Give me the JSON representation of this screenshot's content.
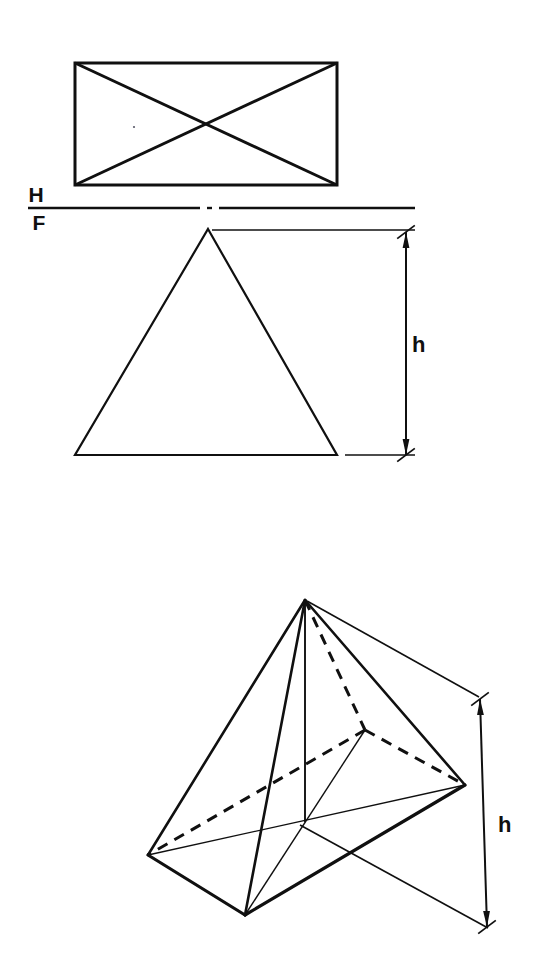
{
  "drawing": {
    "title": "Rectangular pyramid — orthographic and pictorial views",
    "background_color": "#ffffff",
    "line_color": "#101010",
    "views": {
      "top_view": {
        "name": "top-view",
        "description": "Rectangle with two crossing diagonals (plan of pyramid)",
        "rect": {
          "x": 75,
          "y": 63,
          "width": 262,
          "height": 122
        },
        "diagonals": [
          {
            "x1": 75,
            "y1": 63,
            "x2": 337,
            "y2": 185
          },
          {
            "x1": 337,
            "y1": 63,
            "x2": 75,
            "y2": 185
          }
        ],
        "stroke_width": 3.0
      },
      "reference_line": {
        "name": "hf-reference-line",
        "label_above": "H",
        "label_below": "F",
        "segments": [
          {
            "x1": 28,
            "y1": 208,
            "x2": 200,
            "y2": 208
          },
          {
            "x1": 207,
            "y1": 208,
            "x2": 212,
            "y2": 208
          },
          {
            "x1": 219,
            "y1": 208,
            "x2": 415,
            "y2": 208
          }
        ],
        "label_above_pos": {
          "x": 36,
          "y": 202
        },
        "label_below_pos": {
          "x": 39,
          "y": 230
        },
        "stroke_width": 2.4
      },
      "front_view": {
        "name": "front-view",
        "description": "Isosceles triangle (elevation of pyramid)",
        "apex": {
          "x": 208,
          "y": 229
        },
        "base_left": {
          "x": 75,
          "y": 455
        },
        "base_right": {
          "x": 337,
          "y": 455
        },
        "stroke_width": 2.2
      },
      "front_dimension": {
        "name": "height-dimension-front",
        "label": "h",
        "label_pos": {
          "x": 412,
          "y": 352
        },
        "line": {
          "x1": 406,
          "y1": 232,
          "x2": 406,
          "y2": 455
        },
        "extension_top": {
          "x1": 212,
          "y1": 230,
          "x2": 415,
          "y2": 230
        },
        "extension_bottom": {
          "x1": 345,
          "y1": 455,
          "x2": 415,
          "y2": 455
        },
        "stroke_width": 1.6
      },
      "pictorial_view": {
        "name": "pictorial-view",
        "description": "Isometric-style pictorial of rectangular pyramid with hidden back edge",
        "apex": {
          "x": 305,
          "y": 600
        },
        "base_left": {
          "x": 148,
          "y": 855
        },
        "base_front": {
          "x": 245,
          "y": 915
        },
        "base_right": {
          "x": 465,
          "y": 785
        },
        "base_back_hidden": {
          "x": 365,
          "y": 730
        },
        "base_center": {
          "x": 305,
          "y": 822
        },
        "visible_stroke_width": 3.2,
        "thin_stroke_width": 1.4,
        "hidden_stroke_width": 3.0,
        "hidden_dash": "11,8"
      },
      "pictorial_dimension": {
        "name": "height-dimension-pictorial",
        "label": "h",
        "label_pos": {
          "x": 498,
          "y": 832
        },
        "line": {
          "x1": 480,
          "y1": 699,
          "x2": 487,
          "y2": 927
        },
        "extension_top": {
          "x1": 307,
          "y1": 601,
          "x2": 479,
          "y2": 697
        },
        "extension_bottom": {
          "x1": 300,
          "y1": 825,
          "x2": 488,
          "y2": 928
        },
        "stroke_width": 1.6
      }
    },
    "labels": {
      "horizontal_plane": "H",
      "frontal_plane": "F",
      "height_front": "h",
      "height_pictorial": "h"
    }
  }
}
